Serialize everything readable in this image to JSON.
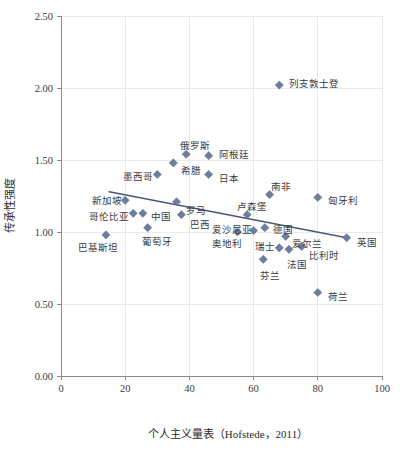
{
  "chart_data": {
    "type": "scatter",
    "title": "",
    "xlabel": "个人主义量表（Hofstede，2011）",
    "ylabel": "传承性强度",
    "xlim": [
      0,
      100
    ],
    "ylim": [
      0.0,
      2.5
    ],
    "xticks": [
      "0",
      "20",
      "40",
      "60",
      "80",
      "100"
    ],
    "xtick_values": [
      0,
      20,
      40,
      60,
      80,
      100
    ],
    "yticks": [
      "0.00",
      "0.50",
      "1.00",
      "1.50",
      "2.00",
      "2.50"
    ],
    "ytick_values": [
      0.0,
      0.5,
      1.0,
      1.5,
      2.0,
      2.5
    ],
    "grid": true,
    "legend": "none",
    "marker_color": "#6d7d9c",
    "trendline_color": "#4a5878",
    "points": [
      {
        "label": "列支敦士登",
        "x": 68.0,
        "y": 2.02,
        "lx": 10,
        "ly": -2
      },
      {
        "label": "俄罗斯",
        "x": 39.0,
        "y": 1.54,
        "lx": -6,
        "ly": -9
      },
      {
        "label": "阿根廷",
        "x": 46.0,
        "y": 1.53,
        "lx": 10,
        "ly": -1
      },
      {
        "label": "希腊",
        "x": 35.0,
        "y": 1.48,
        "lx": 8,
        "ly": 8
      },
      {
        "label": "日本",
        "x": 46.0,
        "y": 1.4,
        "lx": 10,
        "ly": 4
      },
      {
        "label": "墨西哥",
        "x": 30.0,
        "y": 1.4,
        "lx": -34,
        "ly": 2
      },
      {
        "label": "南非",
        "x": 65.0,
        "y": 1.26,
        "lx": 1,
        "ly": -8
      },
      {
        "label": "匈牙利",
        "x": 80.0,
        "y": 1.24,
        "lx": 10,
        "ly": 3
      },
      {
        "label": "新加坡",
        "x": 20.0,
        "y": 1.22,
        "lx": -33,
        "ly": 0
      },
      {
        "label": "罗马",
        "x": 36.0,
        "y": 1.21,
        "lx": 9,
        "ly": 9
      },
      {
        "label": "哥伦比亚",
        "x": 22.5,
        "y": 1.13,
        "lx": -44,
        "ly": 3
      },
      {
        "label": "中国",
        "x": 25.5,
        "y": 1.13,
        "lx": 8,
        "ly": 3
      },
      {
        "label": "卢森堡",
        "x": 58.0,
        "y": 1.12,
        "lx": -10,
        "ly": -8
      },
      {
        "label": "巴西",
        "x": 37.5,
        "y": 1.12,
        "lx": 9,
        "ly": 10
      },
      {
        "label": "爱沙尼亚",
        "x": 60.0,
        "y": 1.01,
        "lx": -42,
        "ly": -1
      },
      {
        "label": "德国",
        "x": 63.5,
        "y": 1.03,
        "lx": 8,
        "ly": 2
      },
      {
        "label": "奥地利",
        "x": 55.0,
        "y": 1.0,
        "lx": -26,
        "ly": 11
      },
      {
        "label": "英国",
        "x": 89.0,
        "y": 0.96,
        "lx": 10,
        "ly": 5
      },
      {
        "label": "爱尔兰",
        "x": 70.0,
        "y": 0.97,
        "lx": 6,
        "ly": 7
      },
      {
        "label": "瑞士",
        "x": 68.0,
        "y": 0.89,
        "lx": -24,
        "ly": -1
      },
      {
        "label": "比利时",
        "x": 75.0,
        "y": 0.9,
        "lx": 7,
        "ly": 9
      },
      {
        "label": "法国",
        "x": 71.0,
        "y": 0.88,
        "lx": -2,
        "ly": 15
      },
      {
        "label": "芬兰",
        "x": 63.0,
        "y": 0.81,
        "lx": -3,
        "ly": 16
      },
      {
        "label": "巴基斯坦",
        "x": 14.0,
        "y": 0.98,
        "lx": -28,
        "ly": 13
      },
      {
        "label": "葡萄牙",
        "x": 27.0,
        "y": 1.03,
        "lx": -6,
        "ly": 14
      },
      {
        "label": "荷兰",
        "x": 80.0,
        "y": 0.58,
        "lx": 10,
        "ly": 4
      }
    ],
    "trendline": {
      "x0": 15.0,
      "y0": 1.28,
      "x1": 89.0,
      "y1": 0.96
    }
  }
}
